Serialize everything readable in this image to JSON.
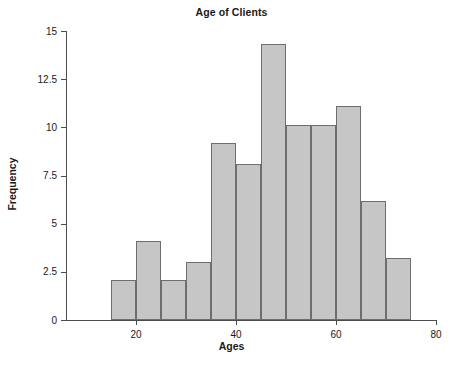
{
  "chart_data": {
    "type": "bar",
    "title": "Age of Clients",
    "xlabel": "Ages",
    "ylabel": "Frequency",
    "categories": [
      "15-20",
      "20-25",
      "25-30",
      "30-35",
      "35-40",
      "40-45",
      "45-50",
      "50-55",
      "55-60",
      "60-65",
      "65-70",
      "70-75"
    ],
    "bin_edges": [
      15,
      20,
      25,
      30,
      35,
      40,
      45,
      50,
      55,
      60,
      65,
      70,
      75
    ],
    "values": [
      2.1,
      4.1,
      2.1,
      3.0,
      9.2,
      8.1,
      14.3,
      10.1,
      10.1,
      11.1,
      6.2,
      3.2
    ],
    "xlim": [
      10,
      80
    ],
    "ylim": [
      0,
      15
    ],
    "xticks": [
      20,
      40,
      60,
      80
    ],
    "xtick_labels": [
      "20",
      "40",
      "60",
      "80"
    ],
    "yticks": [
      0,
      2.5,
      5,
      7.5,
      10,
      12.5,
      15
    ],
    "ytick_labels": [
      "0",
      "2.5",
      "5",
      "7.5",
      "10",
      "12.5",
      "15"
    ],
    "grid": false,
    "legend": "none",
    "bar_fill_color": "#c6c6c6",
    "bar_edge_color": "#6e6e6e",
    "axis_color": "#4d4d4d",
    "background_color": "#ffffff"
  }
}
